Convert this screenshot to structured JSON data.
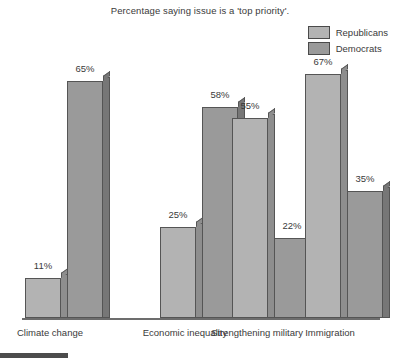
{
  "chart_data": {
    "type": "bar",
    "title": "Percentage saying issue is a 'top priority'.",
    "xlabel": "",
    "ylabel": "",
    "ylim": [
      0,
      72
    ],
    "grid": false,
    "legend_position": "top-right",
    "value_suffix": "%",
    "categories": [
      "Climate change",
      "Economic inequality",
      "Strengthening military",
      "Immigration"
    ],
    "series": [
      {
        "name": "Republicans",
        "color": "#b3b3b3",
        "side_color": "#8e8e8e",
        "values": [
          11,
          25,
          55,
          67
        ],
        "labels": [
          "11%",
          "25%",
          "55%",
          "67%"
        ]
      },
      {
        "name": "Democrats",
        "color": "#9a9a9a",
        "side_color": "#777777",
        "values": [
          65,
          58,
          22,
          35
        ],
        "labels": [
          "65%",
          "58%",
          "22%",
          "35%"
        ]
      }
    ]
  },
  "legend": {
    "items": [
      {
        "label": "Republicans",
        "color": "#b3b3b3"
      },
      {
        "label": "Democrats",
        "color": "#9a9a9a"
      }
    ]
  },
  "axis": {
    "baseline_color": "#6d6d6d"
  }
}
